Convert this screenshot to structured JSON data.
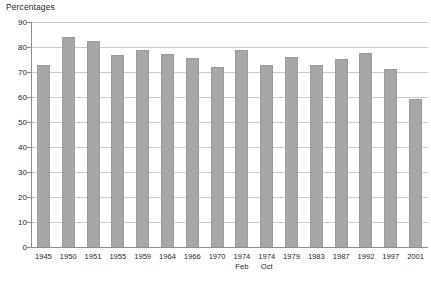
{
  "chart_data": {
    "type": "bar",
    "title": "Percentages",
    "xlabel": "",
    "ylabel": "Percentages",
    "ylim": [
      0,
      90
    ],
    "ytick_step": 10,
    "yticks": [
      0,
      10,
      20,
      30,
      40,
      50,
      60,
      70,
      80,
      90
    ],
    "grid": true,
    "legend": "none",
    "bar_color": "#a7a7a7",
    "categories": [
      "1945",
      "1950",
      "1951",
      "1955",
      "1959",
      "1964",
      "1966",
      "1970",
      "1974 Feb",
      "1974 Oct",
      "1979",
      "1983",
      "1987",
      "1992",
      "1997",
      "2001"
    ],
    "category_lines": [
      {
        "main": "1945",
        "sub": ""
      },
      {
        "main": "1950",
        "sub": ""
      },
      {
        "main": "1951",
        "sub": ""
      },
      {
        "main": "1955",
        "sub": ""
      },
      {
        "main": "1959",
        "sub": ""
      },
      {
        "main": "1964",
        "sub": ""
      },
      {
        "main": "1966",
        "sub": ""
      },
      {
        "main": "1970",
        "sub": ""
      },
      {
        "main": "1974",
        "sub": "Feb"
      },
      {
        "main": "1974",
        "sub": "Oct"
      },
      {
        "main": "1979",
        "sub": ""
      },
      {
        "main": "1983",
        "sub": ""
      },
      {
        "main": "1987",
        "sub": ""
      },
      {
        "main": "1992",
        "sub": ""
      },
      {
        "main": "1997",
        "sub": ""
      },
      {
        "main": "2001",
        "sub": ""
      }
    ],
    "values": [
      72.8,
      83.9,
      82.6,
      76.8,
      78.7,
      77.1,
      75.8,
      72.0,
      78.8,
      72.8,
      76.0,
      72.7,
      75.3,
      77.7,
      71.4,
      59.4
    ]
  }
}
